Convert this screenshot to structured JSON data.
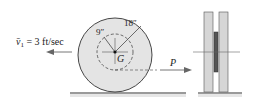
{
  "diagram": {
    "velocity_label": "v̄₁ = 3 ft/sec",
    "velocity_symbol": "v̄",
    "velocity_subscript": "1",
    "velocity_value": " = 3 ft/sec",
    "inner_radius_label": "9″",
    "outer_radius_label": "18″",
    "center_label": "G",
    "force_label": "P",
    "colors": {
      "disk_fill": "#e4e4e4",
      "stroke": "#333333",
      "ground": "#9a9a9a",
      "plate_fill": "#d6d6d6",
      "hub_fill": "#555555"
    }
  }
}
